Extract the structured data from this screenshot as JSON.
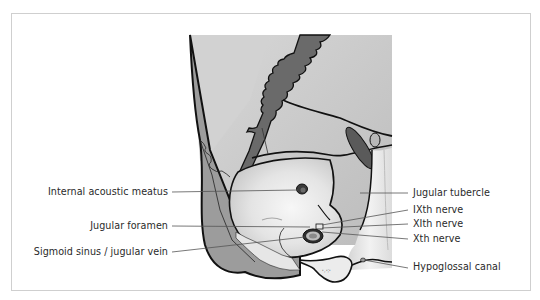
{
  "figure": {
    "type": "anatomical-illustration",
    "labels_left": [
      {
        "id": "internal-acoustic-meatus",
        "text": "Internal acoustic meatus"
      },
      {
        "id": "jugular-foramen",
        "text": "Jugular foramen"
      },
      {
        "id": "sigmoid-sinus",
        "text": "Sigmoid sinus / jugular vein"
      }
    ],
    "labels_right": [
      {
        "id": "jugular-tubercle",
        "text": "Jugular tubercle"
      },
      {
        "id": "ixth-nerve",
        "text": "IXth nerve"
      },
      {
        "id": "xith-nerve",
        "text": "XIth nerve"
      },
      {
        "id": "xth-nerve",
        "text": "Xth nerve"
      },
      {
        "id": "hypoglossal-canal",
        "text": "Hypoglossal canal"
      }
    ],
    "colors": {
      "frame_border": "#cfcfcf",
      "bone_light": "#e6e6e6",
      "bone_mid": "#bdbdbd",
      "bone_dark": "#8f8f8f",
      "sinus_dark": "#6e6e6e",
      "outline": "#111111",
      "leader_line": "#555555"
    }
  }
}
